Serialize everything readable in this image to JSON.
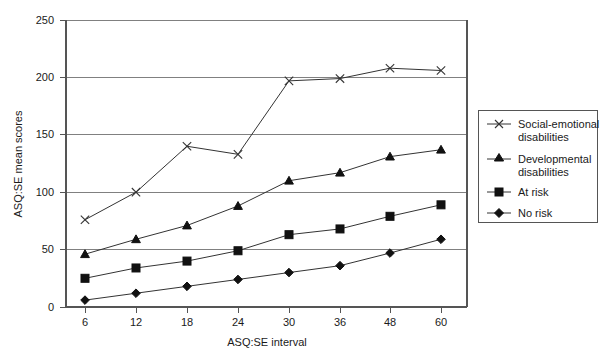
{
  "chart_data": {
    "type": "line",
    "title": "",
    "xlabel": "ASQ:SE interval",
    "ylabel": "ASQ:SE mean scores",
    "categories": [
      "6",
      "12",
      "18",
      "24",
      "30",
      "36",
      "48",
      "60"
    ],
    "x": [
      6,
      12,
      18,
      24,
      30,
      36,
      48,
      60
    ],
    "xlim": [
      0,
      9
    ],
    "ylim": [
      0,
      250
    ],
    "yticks": [
      0,
      50,
      100,
      150,
      200,
      250
    ],
    "grid": "horizontal",
    "legend_position": "right",
    "series": [
      {
        "name": "Social-emotional disabilities",
        "marker": "x",
        "values": [
          76,
          100,
          140,
          133,
          197,
          199,
          208,
          206
        ]
      },
      {
        "name": "Developmental disabilities",
        "marker": "triangle",
        "values": [
          46,
          59,
          71,
          88,
          110,
          117,
          131,
          137
        ]
      },
      {
        "name": "At risk",
        "marker": "square",
        "values": [
          25,
          34,
          40,
          49,
          63,
          68,
          79,
          89
        ]
      },
      {
        "name": "No risk",
        "marker": "diamond",
        "values": [
          6,
          12,
          18,
          24,
          30,
          36,
          47,
          59
        ]
      }
    ]
  },
  "axes": {
    "y_tick_labels": [
      "250",
      "200",
      "150",
      "100",
      "50",
      "0"
    ],
    "x_tick_labels": [
      "6",
      "12",
      "18",
      "24",
      "30",
      "36",
      "48",
      "60"
    ],
    "y_axis_title": "ASQ:SE mean scores",
    "x_axis_title": "ASQ:SE interval"
  },
  "legend": {
    "entries": [
      {
        "label_line1": "Social-emotional",
        "label_line2": "disabilities",
        "marker": "x-marker"
      },
      {
        "label_line1": "Developmental",
        "label_line2": "disabilities",
        "marker": "triangle-marker"
      },
      {
        "label_line1": "At risk",
        "label_line2": "",
        "marker": "square-marker"
      },
      {
        "label_line1": "No risk",
        "label_line2": "",
        "marker": "diamond-marker"
      }
    ]
  },
  "colors": {
    "line": "#333333",
    "grid": "#808080",
    "axis": "#555555",
    "text": "#1a1a1a",
    "background": "#ffffff"
  }
}
